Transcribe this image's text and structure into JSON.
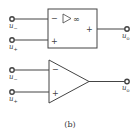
{
  "figure": {
    "caption": "(b)",
    "top_symbol": {
      "type": "rectangular-opamp",
      "inverting_sign": "−",
      "noninverting_sign": "+",
      "output_sign": "+",
      "gain_symbol": "∞",
      "inputs": [
        {
          "label": "u",
          "subscript": "−"
        },
        {
          "label": "u",
          "subscript": "+"
        }
      ],
      "output": {
        "label": "u",
        "subscript": "o"
      }
    },
    "bottom_symbol": {
      "type": "triangular-opamp",
      "inverting_sign": "−",
      "noninverting_sign": "+",
      "inputs": [
        {
          "label": "u",
          "subscript": "−"
        },
        {
          "label": "u",
          "subscript": "+"
        }
      ],
      "output": {
        "label": "u",
        "subscript": "o"
      }
    },
    "colors": {
      "stroke": "#444444",
      "text": "#333333",
      "background": "#ffffff"
    }
  }
}
